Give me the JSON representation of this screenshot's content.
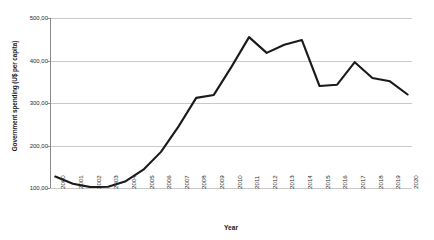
{
  "chart_data": {
    "type": "line",
    "title": "",
    "xlabel": "Year",
    "ylabel": "Government spending (U$ per capita)",
    "categories": [
      "2000",
      "2001",
      "2002",
      "2003",
      "2004",
      "2005",
      "2006",
      "2007",
      "2008",
      "2009",
      "2010",
      "2011",
      "2012",
      "2013",
      "2014",
      "2015",
      "2016",
      "2017",
      "2018",
      "2019",
      "2020"
    ],
    "values": [
      127,
      110,
      102,
      103,
      116,
      143,
      185,
      245,
      312,
      319,
      385,
      455,
      418,
      437,
      448,
      340,
      343,
      396,
      359,
      351,
      320
    ],
    "series": [
      {
        "name": "Government spending",
        "values": [
          127,
          110,
          102,
          103,
          116,
          143,
          185,
          245,
          312,
          319,
          385,
          455,
          418,
          437,
          448,
          340,
          343,
          396,
          359,
          351,
          320
        ]
      }
    ],
    "ylim": [
      100,
      500
    ],
    "ytick_values": [
      100,
      200,
      300,
      400,
      500
    ],
    "ytick_labels": [
      "100,00",
      "200,00",
      "300,00",
      "400,00",
      "500,00"
    ],
    "grid": "horizontal",
    "legend": "none",
    "line_color": "#1a1a1a",
    "gridline_color": "#c9c9c9",
    "background_color": "#ffffff",
    "xtick_rotation": -90
  }
}
